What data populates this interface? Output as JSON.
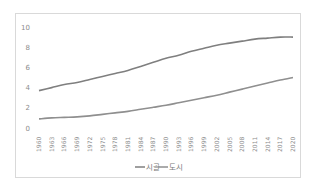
{
  "chart_data": {
    "type": "line",
    "title": "",
    "xlabel": "",
    "ylabel": "",
    "ylim": [
      0,
      10
    ],
    "yticks": [
      0,
      2,
      4,
      6,
      8,
      10
    ],
    "grid": false,
    "legend_position": "bottom",
    "categories": [
      "1960",
      "1963",
      "1966",
      "1969",
      "1972",
      "1975",
      "1978",
      "1981",
      "1984",
      "1987",
      "1990",
      "1993",
      "1996",
      "1999",
      "2002",
      "2005",
      "2008",
      "2011",
      "2014",
      "2017",
      "2020"
    ],
    "series": [
      {
        "name": "시골",
        "color": "#7f7f7f",
        "values": [
          3.7,
          4.0,
          4.3,
          4.5,
          4.8,
          5.1,
          5.4,
          5.7,
          6.1,
          6.5,
          6.9,
          7.2,
          7.6,
          7.9,
          8.2,
          8.4,
          8.6,
          8.8,
          8.9,
          9.0,
          9.0
        ]
      },
      {
        "name": "도시",
        "color": "#8f8f8f",
        "values": [
          0.9,
          1.0,
          1.05,
          1.1,
          1.2,
          1.35,
          1.5,
          1.65,
          1.85,
          2.05,
          2.25,
          2.5,
          2.75,
          3.0,
          3.25,
          3.55,
          3.85,
          4.15,
          4.45,
          4.75,
          5.0
        ]
      }
    ]
  },
  "legend": {
    "items": [
      {
        "label": "시골"
      },
      {
        "label": "도시"
      }
    ]
  }
}
